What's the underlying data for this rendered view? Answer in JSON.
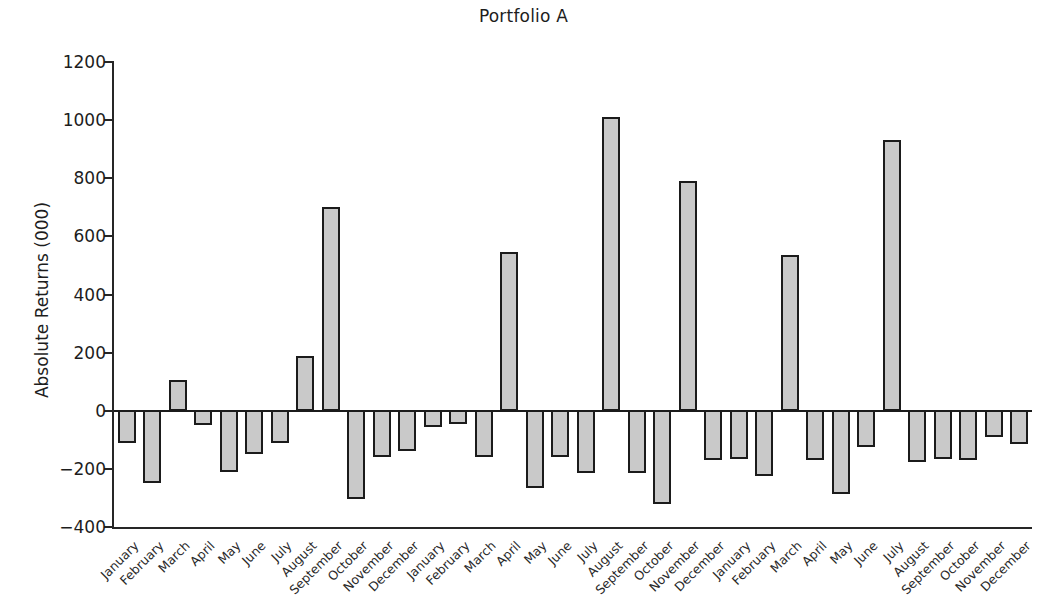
{
  "chart_data": {
    "type": "bar",
    "title": "Portfolio A",
    "xlabel": "",
    "ylabel": "Absolute Returns (000)",
    "ylim": [
      -400,
      1200
    ],
    "ytick_values": [
      1200,
      1000,
      800,
      600,
      400,
      200,
      0,
      -200,
      -400
    ],
    "ytick_labels": [
      "1200",
      "1000",
      "800",
      "600",
      "400",
      "200",
      "0",
      "−200",
      "−400"
    ],
    "grid": false,
    "legend": "none",
    "bar_fill_color": "#c9c9c9",
    "bar_edge_color": "#1b1b1b",
    "categories": [
      "January",
      "February",
      "March",
      "April",
      "May",
      "June",
      "July",
      "August",
      "September",
      "October",
      "November",
      "December",
      "January",
      "February",
      "March",
      "April",
      "May",
      "June",
      "July",
      "August",
      "September",
      "October",
      "November",
      "December",
      "January",
      "February",
      "March",
      "April",
      "May",
      "June",
      "July",
      "August",
      "September",
      "October",
      "November",
      "December"
    ],
    "values": [
      -110,
      -250,
      105,
      -50,
      -210,
      -150,
      -110,
      190,
      700,
      -305,
      -160,
      -140,
      -55,
      -45,
      -160,
      545,
      -265,
      -160,
      -215,
      1010,
      -215,
      -320,
      790,
      -170,
      -165,
      -225,
      535,
      -170,
      -285,
      -125,
      930,
      -175,
      -165,
      -170,
      -90,
      -115
    ]
  }
}
